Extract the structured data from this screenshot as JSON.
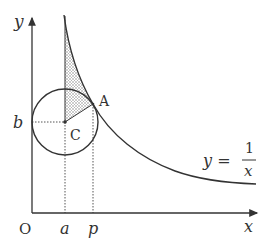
{
  "diagram": {
    "axes": {
      "x_label": "x",
      "y_label": "y",
      "origin_label": "O"
    },
    "ticks": {
      "x": [
        "a",
        "p"
      ],
      "y": [
        "b"
      ]
    },
    "points": {
      "A": "A",
      "C": "C"
    },
    "curve": {
      "lhs": "y =",
      "numerator": "1",
      "denominator": "x"
    },
    "colors": {
      "stroke": "#333333",
      "hatch": "#888888"
    }
  }
}
